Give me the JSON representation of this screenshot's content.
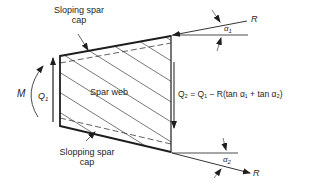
{
  "labels": {
    "top_cap_line1": "Sloping spar",
    "top_cap_line2": "cap",
    "bottom_cap_line1": "Slopping spar",
    "bottom_cap_line2": "cap",
    "web": "Spar web",
    "moment": "M",
    "q1": "Q",
    "q1_sub": "1",
    "q2": "Q",
    "q2_sub": "2",
    "force_top": "R",
    "force_bottom": "R",
    "alpha1": "α",
    "alpha1_sub": "1",
    "alpha2": "α",
    "alpha2_sub": "2",
    "equation": "Q₂ = Q₁ − R(tan α₁ + tan α₂)"
  },
  "colors": {
    "ink": "#1e1e1e",
    "background": "#ffffff"
  }
}
